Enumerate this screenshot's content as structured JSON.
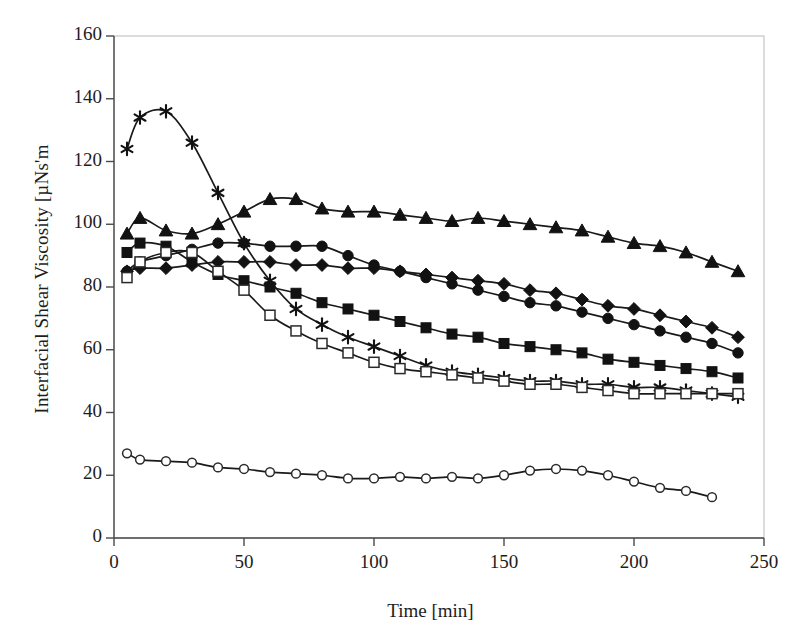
{
  "chart_data": {
    "type": "line",
    "title": "",
    "xlabel": "Time [min]",
    "ylabel": "Interfacial Shear Viscosity [µNs'm",
    "xlim": [
      0,
      250
    ],
    "ylim": [
      0,
      160
    ],
    "xticks": [
      0,
      50,
      100,
      150,
      200,
      250
    ],
    "yticks": [
      0,
      20,
      40,
      60,
      80,
      100,
      120,
      140,
      160
    ],
    "grid": false,
    "legend": "none",
    "series": [
      {
        "name": "star-series",
        "marker": "asterisk",
        "x": [
          5,
          10,
          20,
          30,
          40,
          50,
          60,
          70,
          80,
          90,
          100,
          110,
          120,
          130,
          140,
          150,
          160,
          170,
          180,
          190,
          200,
          210,
          220,
          230,
          240
        ],
        "values": [
          124,
          134,
          136,
          126,
          110,
          94,
          82,
          73,
          68,
          64,
          61,
          58,
          55,
          53,
          52,
          51,
          50,
          50,
          49,
          49,
          48,
          48,
          47,
          46,
          45
        ]
      },
      {
        "name": "filled-triangle-series",
        "marker": "triangle",
        "x": [
          5,
          10,
          20,
          30,
          40,
          50,
          60,
          70,
          80,
          90,
          100,
          110,
          120,
          130,
          140,
          150,
          160,
          170,
          180,
          190,
          200,
          210,
          220,
          230,
          240
        ],
        "values": [
          97,
          102,
          98,
          97,
          100,
          104,
          108,
          108,
          105,
          104,
          104,
          103,
          102,
          101,
          102,
          101,
          100,
          99,
          98,
          96,
          94,
          93,
          91,
          88,
          85
        ]
      },
      {
        "name": "filled-circle-series",
        "marker": "circle",
        "x": [
          5,
          10,
          20,
          30,
          40,
          50,
          60,
          70,
          80,
          90,
          100,
          110,
          120,
          130,
          140,
          150,
          160,
          170,
          180,
          190,
          200,
          210,
          220,
          230,
          240
        ],
        "values": [
          85,
          88,
          90,
          92,
          94,
          94,
          93,
          93,
          93,
          90,
          87,
          85,
          83,
          81,
          79,
          77,
          75,
          74,
          72,
          70,
          68,
          66,
          64,
          62,
          59
        ]
      },
      {
        "name": "filled-diamond-series",
        "marker": "diamond",
        "x": [
          5,
          10,
          20,
          30,
          40,
          50,
          60,
          70,
          80,
          90,
          100,
          110,
          120,
          130,
          140,
          150,
          160,
          170,
          180,
          190,
          200,
          210,
          220,
          230,
          240
        ],
        "values": [
          85,
          86,
          86,
          87,
          88,
          88,
          88,
          87,
          87,
          86,
          86,
          85,
          84,
          83,
          82,
          81,
          79,
          78,
          76,
          74,
          73,
          71,
          69,
          67,
          64
        ]
      },
      {
        "name": "filled-square-series",
        "marker": "square",
        "x": [
          5,
          10,
          20,
          30,
          40,
          50,
          60,
          70,
          80,
          90,
          100,
          110,
          120,
          130,
          140,
          150,
          160,
          170,
          180,
          190,
          200,
          210,
          220,
          230,
          240
        ],
        "values": [
          91,
          94,
          93,
          88,
          84,
          82,
          80,
          78,
          75,
          73,
          71,
          69,
          67,
          65,
          64,
          62,
          61,
          60,
          59,
          57,
          56,
          55,
          54,
          53,
          51
        ]
      },
      {
        "name": "open-square-series",
        "marker": "open-square",
        "x": [
          5,
          10,
          20,
          30,
          40,
          50,
          60,
          70,
          80,
          90,
          100,
          110,
          120,
          130,
          140,
          150,
          160,
          170,
          180,
          190,
          200,
          210,
          220,
          230,
          240
        ],
        "values": [
          83,
          88,
          91,
          91,
          85,
          79,
          71,
          66,
          62,
          59,
          56,
          54,
          53,
          52,
          51,
          50,
          49,
          49,
          48,
          47,
          46,
          46,
          46,
          46,
          46
        ]
      },
      {
        "name": "open-circle-series",
        "marker": "open-circle",
        "x": [
          5,
          10,
          20,
          30,
          40,
          50,
          60,
          70,
          80,
          90,
          100,
          110,
          120,
          130,
          140,
          150,
          160,
          170,
          180,
          190,
          200,
          210,
          220,
          230
        ],
        "values": [
          27,
          25,
          24.5,
          24,
          22.5,
          22,
          21,
          20.5,
          20,
          19,
          19,
          19.5,
          19,
          19.5,
          19,
          20,
          21.5,
          22,
          21.5,
          20,
          18,
          16,
          15,
          13
        ]
      }
    ]
  },
  "axis": {
    "ylabel": "Interfacial Shear Viscosity [µNs'm",
    "xlabel": "Time [min]",
    "ytick_labels": [
      "160",
      "140",
      "120",
      "100",
      "80",
      "60",
      "40",
      "20",
      "0"
    ],
    "xtick_labels": [
      "0",
      "50",
      "100",
      "150",
      "200",
      "250"
    ]
  },
  "colors": {
    "ink": "#121212",
    "axis": "#4a4a4a",
    "border": "#b9b9b9",
    "background": "#ffffff"
  }
}
